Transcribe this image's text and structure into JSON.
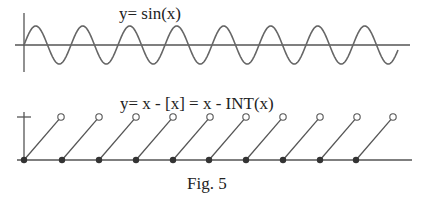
{
  "figure": {
    "caption": "Fig. 5",
    "colors": {
      "stroke": "#555555",
      "text": "#222222",
      "dot": "#333333",
      "background": "#ffffff"
    }
  },
  "sine_plot": {
    "title": "y= sin(x)",
    "x_axis": {
      "x1": 15,
      "x2": 410,
      "y": 45
    },
    "y_axis": {
      "x": 24,
      "y1": 13,
      "y2": 72
    },
    "curve": {
      "x_start": 24,
      "x_end": 398,
      "period_px": 47,
      "amplitude_px": 19,
      "baseline_y": 45
    }
  },
  "sawtooth_plot": {
    "title": "y= x - [x] = x - INT(x)",
    "x_axis": {
      "x1": 17,
      "x2": 412,
      "y": 160
    },
    "y_axis": {
      "x": 24,
      "y1": 112,
      "y2": 160
    },
    "unit_tick": {
      "x1": 17,
      "x2": 31,
      "y": 117
    },
    "segments": [
      {
        "x0": 24,
        "x1": 61
      },
      {
        "x0": 62,
        "x1": 99
      },
      {
        "x0": 99,
        "x1": 136
      },
      {
        "x0": 136,
        "x1": 173
      },
      {
        "x0": 173,
        "x1": 210
      },
      {
        "x0": 209,
        "x1": 246
      },
      {
        "x0": 246,
        "x1": 283
      },
      {
        "x0": 283,
        "x1": 320
      },
      {
        "x0": 320,
        "x1": 357
      },
      {
        "x0": 356,
        "x1": 393
      }
    ],
    "top_y": 117,
    "bottom_y": 160
  },
  "chart_data": [
    {
      "type": "line",
      "title": "y= sin(x)",
      "xlabel": "",
      "ylabel": "",
      "function": "sin(x)",
      "periods_shown": 8,
      "ylim": [
        -1,
        1
      ],
      "grid": false
    },
    {
      "type": "line",
      "title": "y= x - [x] = x - INT(x)",
      "xlabel": "",
      "ylabel": "",
      "function": "x - INT(x)",
      "x": [
        0,
        1,
        2,
        3,
        4,
        5,
        6,
        7,
        8,
        9
      ],
      "segment_start_values": [
        0,
        0,
        0,
        0,
        0,
        0,
        0,
        0,
        0,
        0
      ],
      "segment_end_values_open": [
        1,
        1,
        1,
        1,
        1,
        1,
        1,
        1,
        1,
        1
      ],
      "ylim": [
        0,
        1
      ],
      "y_tick": [
        1
      ],
      "markers": {
        "closed": "segment start (filled dot)",
        "open": "segment end (open circle)"
      },
      "grid": false
    }
  ]
}
